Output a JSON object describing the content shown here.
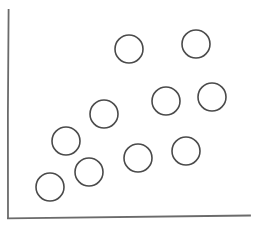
{
  "figure": {
    "width": 259,
    "height": 229,
    "background_color": "#ffffff",
    "style": "hand-drawn sketch"
  },
  "chart_data": {
    "type": "scatter",
    "title": "",
    "subtitle": "",
    "xlabel": "",
    "ylabel": "",
    "xlim": [
      0,
      259
    ],
    "ylim": [
      0,
      229
    ],
    "grid": false,
    "legend": null,
    "tick_labels": {
      "x": [],
      "y": []
    },
    "annotations": [],
    "marker": {
      "shape": "circle",
      "filled": false,
      "radius": 14,
      "edge_color": "#4a4a4a",
      "face_color": "none",
      "stroke_width": 1.6
    },
    "point_count": 10,
    "trend": "positive correlation",
    "points": [
      {
        "id": "p1",
        "x": 50,
        "y": 187,
        "label": ""
      },
      {
        "id": "p2",
        "x": 89,
        "y": 172,
        "label": ""
      },
      {
        "id": "p3",
        "x": 66,
        "y": 141,
        "label": ""
      },
      {
        "id": "p4",
        "x": 138,
        "y": 158,
        "label": ""
      },
      {
        "id": "p5",
        "x": 186,
        "y": 151,
        "label": ""
      },
      {
        "id": "p6",
        "x": 104,
        "y": 114,
        "label": ""
      },
      {
        "id": "p7",
        "x": 166,
        "y": 101,
        "label": ""
      },
      {
        "id": "p8",
        "x": 212,
        "y": 97,
        "label": ""
      },
      {
        "id": "p9",
        "x": 129,
        "y": 49,
        "label": ""
      },
      {
        "id": "p10",
        "x": 196,
        "y": 44,
        "label": ""
      }
    ],
    "axes": {
      "color": "#6b6b6b",
      "stroke_width": 1.8,
      "y_axis": {
        "x": 8,
        "y_top": 10,
        "y_bottom": 218
      },
      "x_axis": {
        "y": 218,
        "x_left": 8,
        "x_right": 250
      }
    }
  }
}
